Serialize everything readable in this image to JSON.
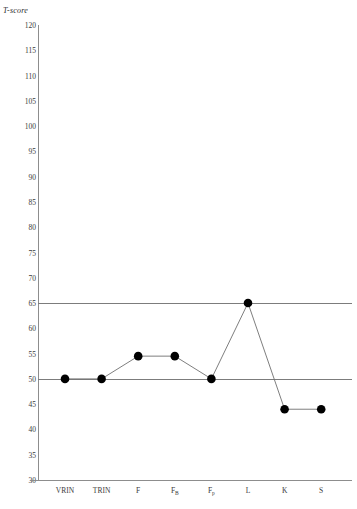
{
  "chart_data": {
    "type": "line",
    "title": "",
    "subtitle": "",
    "ylabel": "T-score",
    "xlabel": "",
    "categories": [
      "VRIN",
      "TRIN",
      "F",
      "FB",
      "Fp",
      "L",
      "K",
      "S"
    ],
    "category_labels": [
      {
        "base": "VRIN",
        "sub": ""
      },
      {
        "base": "TRIN",
        "sub": ""
      },
      {
        "base": "F",
        "sub": ""
      },
      {
        "base": "F",
        "sub": "B"
      },
      {
        "base": "F",
        "sub": "p"
      },
      {
        "base": "L",
        "sub": ""
      },
      {
        "base": "K",
        "sub": ""
      },
      {
        "base": "S",
        "sub": ""
      }
    ],
    "values": [
      50,
      50,
      54.5,
      54.5,
      50,
      65,
      44,
      44
    ],
    "ylim": [
      30,
      120
    ],
    "yticks": [
      30,
      35,
      40,
      45,
      50,
      55,
      60,
      65,
      70,
      75,
      80,
      85,
      90,
      95,
      100,
      105,
      110,
      115,
      120
    ],
    "ytick_labels": [
      "30",
      "35",
      "40",
      "45",
      "50",
      "55",
      "60",
      "65",
      "70",
      "75",
      "80",
      "85",
      "90",
      "95",
      "100",
      "105",
      "110",
      "115",
      "120"
    ],
    "reference_lines": [
      50,
      65
    ],
    "grid": false,
    "legend": "none",
    "marker": "filled-circle",
    "marker_color": "#000000",
    "line_color": "#6f6f6f",
    "axis_color": "#8d8d8d",
    "reference_line_color": "#7c7c7c"
  }
}
